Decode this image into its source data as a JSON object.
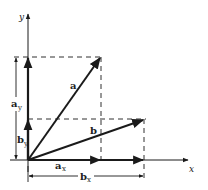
{
  "diagram": {
    "axes": {
      "x_label": "x",
      "y_label": "y"
    },
    "vectors": [
      {
        "name": "a",
        "label": "a"
      },
      {
        "name": "b",
        "label": "b"
      }
    ],
    "components": {
      "a_x": {
        "base": "a",
        "sub": "x"
      },
      "a_y": {
        "base": "a",
        "sub": "y"
      },
      "b_x": {
        "base": "b",
        "sub": "x"
      },
      "b_y": {
        "base": "b",
        "sub": "y"
      }
    },
    "colors": {
      "line": "#1a1a1a",
      "background": "#ffffff"
    }
  }
}
